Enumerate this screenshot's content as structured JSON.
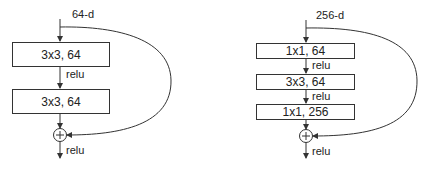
{
  "left_block": {
    "input_label": "64-d",
    "layers": [
      {
        "label": "3x3, 64"
      },
      {
        "label": "3x3, 64"
      }
    ],
    "activations": [
      "relu",
      "relu"
    ],
    "add_symbol": "+"
  },
  "right_block": {
    "input_label": "256-d",
    "layers": [
      {
        "label": "1x1, 64"
      },
      {
        "label": "3x3, 64"
      },
      {
        "label": "1x1, 256"
      }
    ],
    "activations": [
      "relu",
      "relu",
      "relu"
    ],
    "add_symbol": "+"
  }
}
